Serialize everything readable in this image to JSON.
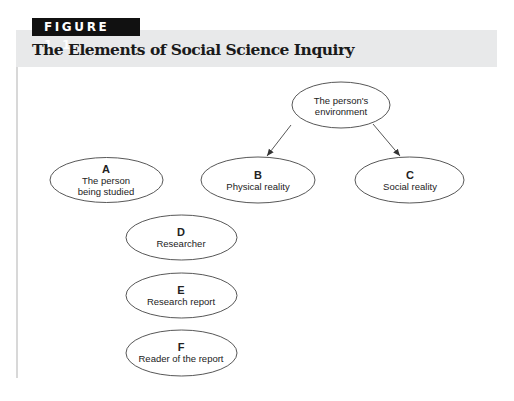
{
  "figure": {
    "label": "FIGURE 1.1",
    "title": "The Elements of Social Science Inquiry"
  },
  "nodes": {
    "environment": {
      "letter": "",
      "lines": [
        "The person's",
        "environment"
      ],
      "line1": "The person's",
      "line2": "environment"
    },
    "A": {
      "letter": "A",
      "line1": "The person",
      "line2": "being studied"
    },
    "B": {
      "letter": "B",
      "line1": "Physical reality"
    },
    "C": {
      "letter": "C",
      "line1": "Social reality"
    },
    "D": {
      "letter": "D",
      "line1": "Researcher"
    },
    "E": {
      "letter": "E",
      "line1": "Research report"
    },
    "F": {
      "letter": "F",
      "line1": "Reader of the report"
    }
  },
  "edges": [
    {
      "from": "environment",
      "to": "B"
    },
    {
      "from": "environment",
      "to": "C"
    }
  ],
  "colors": {
    "header_band": "#e8e9ea",
    "label_bg": "#111111",
    "stroke": "#333333"
  }
}
